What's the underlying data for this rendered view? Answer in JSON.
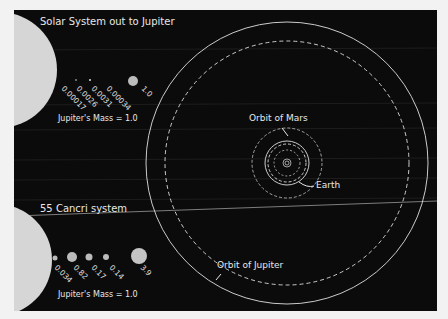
{
  "solar_system": {
    "title": "Solar System out to Jupiter",
    "masses": [
      "0.00017",
      "0.0026",
      "0.0031",
      "0.00034",
      "1.0"
    ],
    "mass_note": "Jupiter's Mass = 1.0"
  },
  "cancri": {
    "title": "55 Cancri system",
    "masses": [
      "0.034",
      "0.82",
      "0.17",
      "0.14",
      "3.9"
    ],
    "mass_note": "Jupiter's Mass = 1.0"
  },
  "orbit_labels": {
    "mars": "Orbit of Mars",
    "earth": "Earth",
    "jupiter": "Orbit of Jupiter"
  },
  "colors": {
    "background": "#0b0b0b",
    "orbit_line": "#e0e0e0",
    "star": "#d8d8d8"
  }
}
